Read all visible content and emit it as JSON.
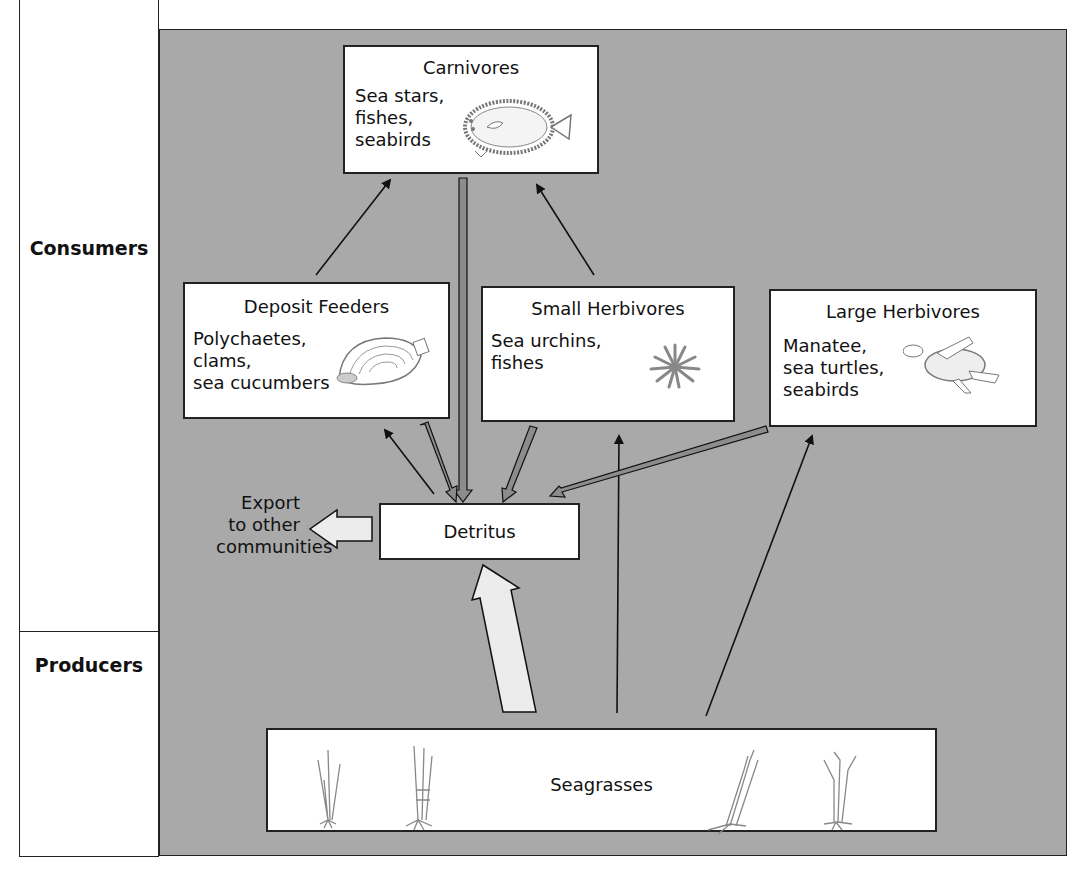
{
  "diagram": {
    "levels": {
      "consumers": "Consumers",
      "producers": "Producers"
    },
    "nodes": {
      "carnivores": {
        "title": "Carnivores",
        "examples": "Sea stars,\nfishes,\nseabirds",
        "icon": "flatfish-icon"
      },
      "deposit_feeders": {
        "title": "Deposit Feeders",
        "examples": "Polychaetes,\nclams,\nsea cucumbers",
        "icon": "clam-icon"
      },
      "small_herbivores": {
        "title": "Small Herbivores",
        "examples": "Sea urchins,\nfishes",
        "icon": "sea-urchin-icon"
      },
      "large_herbivores": {
        "title": "Large Herbivores",
        "examples": "Manatee,\nsea turtles,\nseabirds",
        "icon": "sea-turtle-icon"
      },
      "detritus": {
        "title": "Detritus"
      },
      "seagrasses": {
        "title": "Seagrasses",
        "icon": "seagrass-icon"
      },
      "export": {
        "title": "Export\nto other\ncommunities"
      }
    },
    "edges": [
      {
        "from": "deposit_feeders",
        "to": "carnivores",
        "style": "thin"
      },
      {
        "from": "small_herbivores",
        "to": "carnivores",
        "style": "thin"
      },
      {
        "from": "carnivores",
        "to": "detritus",
        "style": "double"
      },
      {
        "from": "deposit_feeders",
        "to": "detritus",
        "style": "double"
      },
      {
        "from": "detritus",
        "to": "deposit_feeders",
        "style": "thin"
      },
      {
        "from": "small_herbivores",
        "to": "detritus",
        "style": "double"
      },
      {
        "from": "large_herbivores",
        "to": "detritus",
        "style": "double"
      },
      {
        "from": "seagrasses",
        "to": "small_herbivores",
        "style": "thin"
      },
      {
        "from": "seagrasses",
        "to": "large_herbivores",
        "style": "thin"
      },
      {
        "from": "seagrasses",
        "to": "detritus",
        "style": "block-large"
      },
      {
        "from": "detritus",
        "to": "export",
        "style": "block"
      }
    ],
    "colors": {
      "panel": "#a9a9a9",
      "box": "#ffffff",
      "stroke": "#222222",
      "block_arrow": "#ececec"
    }
  }
}
